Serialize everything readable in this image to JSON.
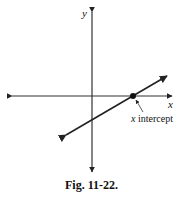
{
  "figure": {
    "caption": "Fig. 11-22.",
    "axes": {
      "x_label": "x",
      "y_label": "y"
    },
    "annotation": "x intercept",
    "colors": {
      "stroke": "#222222",
      "background": "#ffffff"
    }
  }
}
